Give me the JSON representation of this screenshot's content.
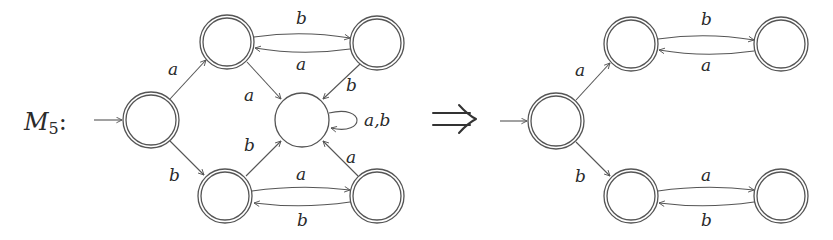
{
  "machine": {
    "name": "M",
    "subscript": "5",
    "colon": ":"
  },
  "transform_symbol": "⇒",
  "colors": {
    "stroke": "#555555",
    "text": "#2a2a2a",
    "background": "#ffffff"
  },
  "left_automaton": {
    "states": [
      {
        "id": "q0",
        "role": "start",
        "accepting": true,
        "cx": 151,
        "cy": 120
      },
      {
        "id": "qa",
        "role": "upper-left",
        "accepting": true,
        "cx": 227,
        "cy": 42
      },
      {
        "id": "qab",
        "role": "upper-right",
        "accepting": true,
        "cx": 377,
        "cy": 43
      },
      {
        "id": "dead",
        "role": "sink",
        "accepting": false,
        "cx": 302,
        "cy": 120
      },
      {
        "id": "qb",
        "role": "lower-left",
        "accepting": true,
        "cx": 225,
        "cy": 196
      },
      {
        "id": "qba",
        "role": "lower-right",
        "accepting": true,
        "cx": 377,
        "cy": 196
      }
    ],
    "labels": {
      "q0_qa": "a",
      "q0_qb": "b",
      "qa_qab": "b",
      "qab_qa": "a",
      "qa_dead": "a",
      "qab_dead": "b",
      "dead_loop": "a,b",
      "qb_dead": "b",
      "qba_dead": "a",
      "qb_qba": "a",
      "qba_qb": "b"
    }
  },
  "right_automaton": {
    "states": [
      {
        "id": "q0",
        "role": "start",
        "accepting": true,
        "cx": 556,
        "cy": 121
      },
      {
        "id": "qa",
        "role": "upper-left",
        "accepting": true,
        "cx": 631,
        "cy": 44
      },
      {
        "id": "qab",
        "role": "upper-right",
        "accepting": true,
        "cx": 781,
        "cy": 44
      },
      {
        "id": "qb",
        "role": "lower-left",
        "accepting": true,
        "cx": 631,
        "cy": 196
      },
      {
        "id": "qba",
        "role": "lower-right",
        "accepting": true,
        "cx": 781,
        "cy": 196
      }
    ],
    "labels": {
      "q0_qa": "a",
      "q0_qb": "b",
      "qa_qab": "b",
      "qab_qa": "a",
      "qb_qba": "a",
      "qba_qb": "b"
    }
  }
}
